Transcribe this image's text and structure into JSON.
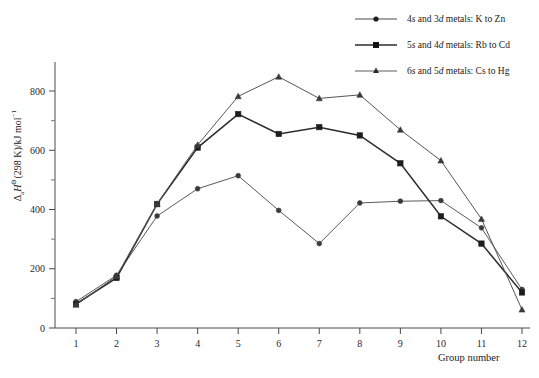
{
  "chart_data": {
    "type": "line",
    "title": "",
    "xlabel": "Group number",
    "ylabel": "ΔaH°(298 K)/kJ mol⁻¹",
    "x": [
      1,
      2,
      3,
      4,
      5,
      6,
      7,
      8,
      9,
      10,
      11,
      12
    ],
    "xlim": [
      0.5,
      12.5
    ],
    "ylim": [
      0,
      900
    ],
    "yticks": [
      0,
      200,
      400,
      600,
      800
    ],
    "xticks": [
      1,
      2,
      3,
      4,
      5,
      6,
      7,
      8,
      9,
      10,
      11,
      12
    ],
    "grid": false,
    "legend_position": "top-right",
    "series": [
      {
        "name": "4s and 3d metals: K to Zn",
        "marker": "circle",
        "color": "#5a5a5a",
        "values": [
          89,
          178,
          378,
          470,
          514,
          397,
          285,
          422,
          428,
          430,
          338,
          130
        ]
      },
      {
        "name": "5s and 4d metals: Rb to Cd",
        "marker": "square",
        "color": "#2b2b2b",
        "values": [
          81,
          169,
          418,
          609,
          722,
          655,
          678,
          650,
          556,
          377,
          285,
          120
        ]
      },
      {
        "name": "6s and 5d metals: Cs to Hg",
        "marker": "triangle",
        "color": "#555555",
        "values": [
          78,
          175,
          419,
          618,
          782,
          848,
          775,
          787,
          669,
          565,
          368,
          62
        ]
      }
    ]
  },
  "axes": {
    "y_tick_labels": [
      "0",
      "200",
      "400",
      "600",
      "800"
    ],
    "x_tick_labels": [
      "1",
      "2",
      "3",
      "4",
      "5",
      "6",
      "7",
      "8",
      "9",
      "10",
      "11",
      "12"
    ],
    "x_axis_title": "Group number",
    "y_axis_title_parts": {
      "delta": "Δ",
      "sub_a": "a",
      "h": "H",
      "sup_standard": "⊖",
      "condition": "(298 K)/kJ mol",
      "sup_minus_one": "−1"
    }
  },
  "legend": {
    "entries": [
      {
        "marker": "circle-marker",
        "prefix": "4",
        "italic1": "s",
        "middle": " and 3",
        "italic2": "d",
        "suffix": " metals: K to Zn",
        "full": "4s and 3d metals: K to Zn"
      },
      {
        "marker": "square-marker",
        "prefix": "5",
        "italic1": "s",
        "middle": " and 4",
        "italic2": "d",
        "suffix": " metals: Rb to Cd",
        "full": "5s and 4d metals: Rb to Cd"
      },
      {
        "marker": "triangle-marker",
        "prefix": "6",
        "italic1": "s",
        "middle": " and 5",
        "italic2": "d",
        "suffix": " metals: Cs to Hg",
        "full": "6s and 5d metals: Cs to Hg"
      }
    ]
  },
  "colors": {
    "axis": "#4a4a4a",
    "text": "#1a1a1a",
    "series1": "#5a5a5a",
    "series2": "#2b2b2b",
    "series3": "#555555",
    "background": "#ffffff"
  }
}
